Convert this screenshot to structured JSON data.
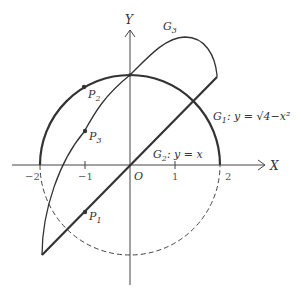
{
  "diagram": {
    "axes": {
      "x_label": "X",
      "y_label": "Y",
      "origin_label": "O",
      "x_ticks": [
        "−2",
        "−1",
        "1",
        "2"
      ]
    },
    "curves": {
      "g1_label": "G",
      "g1_sub": "1",
      "g1_eq": ": y = √4−x²",
      "g2_label": "G",
      "g2_sub": "2",
      "g2_eq": ": y = x",
      "g3_label": "G",
      "g3_sub": "3"
    },
    "points": [
      {
        "name": "P",
        "sub": "1"
      },
      {
        "name": "P",
        "sub": "2"
      },
      {
        "name": "P",
        "sub": "3"
      }
    ],
    "colors": {
      "stroke": "#333333",
      "axis": "#444444"
    }
  }
}
